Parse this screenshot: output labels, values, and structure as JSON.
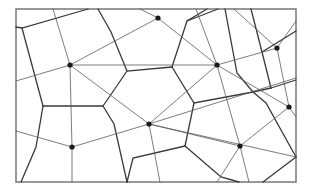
{
  "diagram": {
    "type": "voronoi-delaunay",
    "colors": {
      "frame": "#6e6e6e",
      "voronoi_edge": "#3a3a3a",
      "delaunay_edge": "#5a5a5a",
      "site": "#1a1a1a",
      "background": "#ffffff"
    },
    "site_count": 8
  }
}
